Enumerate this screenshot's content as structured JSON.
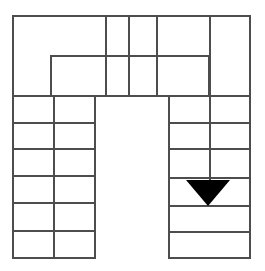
{
  "canvas": {
    "width": 265,
    "height": 271,
    "background": "#ffffff"
  },
  "diagram": {
    "title": "Maze grid with downward arrow marker",
    "type": "line-diagram",
    "stroke_color": "#4d4d4d",
    "stroke_width": 2,
    "fill_none": "none",
    "marker": {
      "name": "down-triangle-marker",
      "shape": "triangle",
      "direction": "down",
      "fill": "#000000",
      "points": "186,180 230,180 208,206",
      "center_x": 208,
      "top_y": 180,
      "apex_y": 206,
      "width": 44,
      "height": 26
    },
    "outer_boundary": {
      "name": "outer-boundary-path",
      "description": "U-shaped outer outline open at the bottom middle",
      "d": "M 13 16 L 250 16 L 250 258 L 169 258 L 169 96 L 95 96 L 95 258 L 13 258 Z"
    },
    "inner_rect": {
      "name": "inner-rectangle-path",
      "description": "Inner rectangle in the top band, open along the bottom between x=106 and x=157",
      "d": "M 51 96 L 51 56 L 209 56 L 209 96"
    },
    "lines": [
      {
        "name": "top-vertical-1",
        "x1": 106,
        "y1": 16,
        "x2": 106,
        "y2": 96
      },
      {
        "name": "top-vertical-2",
        "x1": 129,
        "y1": 16,
        "x2": 129,
        "y2": 96
      },
      {
        "name": "top-vertical-3",
        "x1": 157,
        "y1": 16,
        "x2": 157,
        "y2": 96
      },
      {
        "name": "top-band-horizontal",
        "x1": 13,
        "y1": 96,
        "x2": 250,
        "y2": 96
      },
      {
        "name": "left-column-divider",
        "x1": 54,
        "y1": 96,
        "x2": 54,
        "y2": 258
      },
      {
        "name": "left-row-line-1",
        "x1": 13,
        "y1": 123,
        "x2": 95,
        "y2": 123
      },
      {
        "name": "left-row-line-2",
        "x1": 13,
        "y1": 149,
        "x2": 95,
        "y2": 149
      },
      {
        "name": "left-row-line-3",
        "x1": 13,
        "y1": 176,
        "x2": 95,
        "y2": 176
      },
      {
        "name": "left-row-line-4",
        "x1": 13,
        "y1": 203,
        "x2": 95,
        "y2": 203
      },
      {
        "name": "left-row-line-5",
        "x1": 13,
        "y1": 231,
        "x2": 95,
        "y2": 231
      },
      {
        "name": "right-column-divider",
        "x1": 210,
        "y1": 16,
        "x2": 210,
        "y2": 180
      },
      {
        "name": "right-row-line-1",
        "x1": 169,
        "y1": 123,
        "x2": 250,
        "y2": 123
      },
      {
        "name": "right-row-line-2",
        "x1": 169,
        "y1": 149,
        "x2": 250,
        "y2": 149
      },
      {
        "name": "right-row-line-3",
        "x1": 169,
        "y1": 178,
        "x2": 250,
        "y2": 178
      },
      {
        "name": "right-row-line-4",
        "x1": 169,
        "y1": 206,
        "x2": 250,
        "y2": 206
      },
      {
        "name": "right-row-line-5",
        "x1": 169,
        "y1": 232,
        "x2": 250,
        "y2": 232
      }
    ]
  }
}
